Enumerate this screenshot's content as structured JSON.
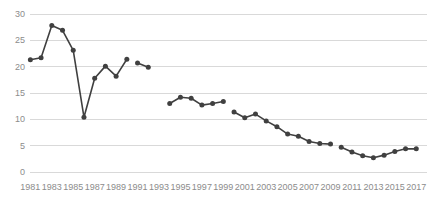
{
  "chart_data": {
    "type": "line",
    "title": "",
    "subtitle": "",
    "xlabel": "",
    "ylabel": "",
    "xlim": [
      1980.5,
      2018.0
    ],
    "ylim": [
      0,
      30
    ],
    "grid": true,
    "legend": false,
    "legend_position": "none",
    "series_color": "#404040",
    "gridline_color": "#d9d9d9",
    "tick_label_color": "#8c8c8c",
    "background_color": "#ffffff",
    "marker": "circle",
    "y_ticks": [
      0,
      5,
      10,
      15,
      20,
      25,
      30
    ],
    "y_tick_labels": [
      "0",
      "5",
      "10",
      "15",
      "20",
      "25",
      "30"
    ],
    "x_ticks": [
      1981,
      1983,
      1985,
      1987,
      1989,
      1991,
      1993,
      1995,
      1997,
      1999,
      2001,
      2003,
      2005,
      2007,
      2009,
      2011,
      2013,
      2015,
      2017
    ],
    "x_tick_labels": [
      "1981",
      "1983",
      "1985",
      "1987",
      "1989",
      "1991",
      "1993",
      "1995",
      "1997",
      "1999",
      "2001",
      "2003",
      "2005",
      "2007",
      "2009",
      "2011",
      "2013",
      "2015",
      "2017"
    ],
    "series": [
      {
        "name": "Series 1",
        "x": [
          1981,
          1982,
          1983,
          1984,
          1985,
          1986,
          1987,
          1988,
          1989,
          1990,
          1991,
          1992,
          1994,
          1995,
          1996,
          1997,
          1998,
          1999,
          2000,
          2001,
          2002,
          2003,
          2004,
          2005,
          2006,
          2007,
          2008,
          2009,
          2010,
          2011,
          2012,
          2013,
          2014,
          2015,
          2016,
          2017
        ],
        "values": [
          21.3,
          21.7,
          27.8,
          26.9,
          23.1,
          10.4,
          17.8,
          20.1,
          18.2,
          21.4,
          20.7,
          19.9,
          13.0,
          14.2,
          14.0,
          12.7,
          13.0,
          13.4,
          11.4,
          10.3,
          11.0,
          9.7,
          8.6,
          7.2,
          6.8,
          5.8,
          5.4,
          5.3,
          4.7,
          3.8,
          3.1,
          2.7,
          3.2,
          3.9,
          4.4,
          4.4
        ],
        "segments": [
          {
            "x": [
              1981,
              1982,
              1983,
              1984,
              1985,
              1986,
              1987,
              1988,
              1989,
              1990
            ],
            "values": [
              21.3,
              21.7,
              27.8,
              26.9,
              23.1,
              10.4,
              17.8,
              20.1,
              18.2,
              21.4
            ]
          },
          {
            "x": [
              1991,
              1992
            ],
            "values": [
              20.7,
              19.9
            ]
          },
          {
            "x": [
              1994,
              1995,
              1996,
              1997,
              1998,
              1999
            ],
            "values": [
              13.0,
              14.2,
              14.0,
              12.7,
              13.0,
              13.4
            ]
          },
          {
            "x": [
              2000,
              2001,
              2002,
              2003,
              2004,
              2005,
              2006,
              2007,
              2008,
              2009
            ],
            "values": [
              11.4,
              10.3,
              11.0,
              9.7,
              8.6,
              7.2,
              6.8,
              5.8,
              5.4,
              5.3
            ]
          },
          {
            "x": [
              2010,
              2011,
              2012,
              2013,
              2014,
              2015,
              2016,
              2017
            ],
            "values": [
              4.7,
              3.8,
              3.1,
              2.7,
              3.2,
              3.9,
              4.4,
              4.4
            ]
          }
        ]
      }
    ]
  }
}
